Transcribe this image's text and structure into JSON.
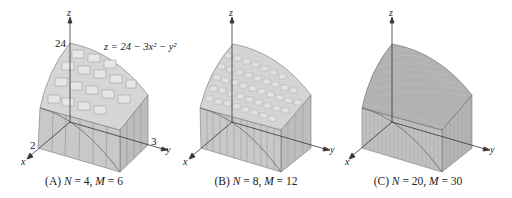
{
  "figure": {
    "equation": "z = 24 − 3x² − y²",
    "panels": [
      {
        "id": "A",
        "caption_prefix": "(A) ",
        "n_label": "N",
        "n_value": "4",
        "m_label": "M",
        "m_value": "6",
        "caption": "(A) N = 4, M = 6",
        "z_max_label": "24",
        "x_label": "2",
        "y_label": "3",
        "nx": 4,
        "my": 6
      },
      {
        "id": "B",
        "caption_prefix": "(B) ",
        "n_label": "N",
        "n_value": "8",
        "m_label": "M",
        "m_value": "12",
        "caption": "(B) N = 8, M = 12",
        "nx": 8,
        "my": 12
      },
      {
        "id": "C",
        "caption_prefix": "(C) ",
        "n_label": "N",
        "n_value": "20",
        "m_label": "M",
        "m_value": "30",
        "caption": "(C) N = 20, M = 30",
        "nx": 20,
        "my": 30
      }
    ],
    "axes": {
      "x": "x",
      "y": "y",
      "z": "z"
    },
    "colors": {
      "front_face": "#c6c6c6",
      "side_face": "#b9b9b9",
      "top_surface": "#d4d4d4",
      "lines": "#666666",
      "axes": "#333333"
    }
  }
}
